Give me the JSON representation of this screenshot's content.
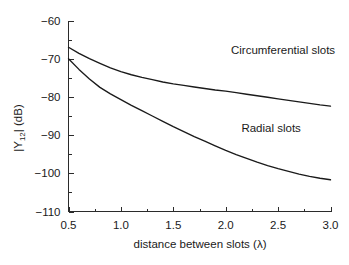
{
  "chart_data": {
    "type": "line",
    "title": "",
    "xlabel": "distance between slots (λ)",
    "ylabel": "|Y12| (dB)",
    "ylabel_parts": {
      "pre": "|Y",
      "sub": "12",
      "post": "| (dB)"
    },
    "xlim": [
      0.5,
      3.0
    ],
    "ylim": [
      -110,
      -60
    ],
    "xticks": [
      0.5,
      1.0,
      1.5,
      2.0,
      2.5,
      3.0
    ],
    "xtick_labels": [
      "0.5",
      "1.0",
      "1.5",
      "2.0",
      "2.5",
      "3.0"
    ],
    "yticks": [
      -110,
      -100,
      -90,
      -80,
      -70,
      -60
    ],
    "ytick_labels": [
      "−110",
      "−100",
      "−90",
      "−80",
      "−70",
      "−60"
    ],
    "x_minor_ticks": [
      0.75,
      1.25,
      1.75,
      2.25,
      2.75
    ],
    "y_minor_ticks": [
      -105,
      -95,
      -85,
      -75,
      -65
    ],
    "grid": false,
    "legend_position": "inline-annotations",
    "series": [
      {
        "name": "Circumferential slots",
        "color": "#1a1a1a",
        "x": [
          0.5,
          0.6,
          0.7,
          0.8,
          0.9,
          1.0,
          1.1,
          1.2,
          1.3,
          1.4,
          1.5,
          1.6,
          1.7,
          1.8,
          1.9,
          2.0,
          2.1,
          2.2,
          2.3,
          2.4,
          2.5,
          2.6,
          2.7,
          2.8,
          2.9,
          3.0
        ],
        "values": [
          -67.0,
          -68.6,
          -70.0,
          -71.2,
          -72.4,
          -73.4,
          -74.2,
          -74.9,
          -75.5,
          -76.1,
          -76.6,
          -77.0,
          -77.4,
          -77.8,
          -78.2,
          -78.5,
          -78.9,
          -79.3,
          -79.7,
          -80.1,
          -80.5,
          -80.9,
          -81.3,
          -81.7,
          -82.1,
          -82.4
        ]
      },
      {
        "name": "Radial slots",
        "color": "#1a1a1a",
        "x": [
          0.5,
          0.6,
          0.7,
          0.8,
          0.9,
          1.0,
          1.1,
          1.2,
          1.3,
          1.4,
          1.5,
          1.6,
          1.7,
          1.8,
          1.9,
          2.0,
          2.1,
          2.2,
          2.3,
          2.4,
          2.5,
          2.6,
          2.7,
          2.8,
          2.9,
          3.0
        ],
        "values": [
          -70.0,
          -72.8,
          -75.3,
          -77.5,
          -79.2,
          -80.7,
          -82.2,
          -83.6,
          -85.0,
          -86.4,
          -87.8,
          -89.1,
          -90.4,
          -91.6,
          -92.8,
          -94.0,
          -95.1,
          -96.1,
          -97.1,
          -98.0,
          -98.8,
          -99.5,
          -100.2,
          -100.8,
          -101.3,
          -101.7
        ]
      }
    ],
    "annotations": [
      {
        "text": "Circumferential slots",
        "x": 2.05,
        "y": -68.7
      },
      {
        "text": "Radial slots",
        "x": 2.15,
        "y": -89.2
      }
    ]
  }
}
